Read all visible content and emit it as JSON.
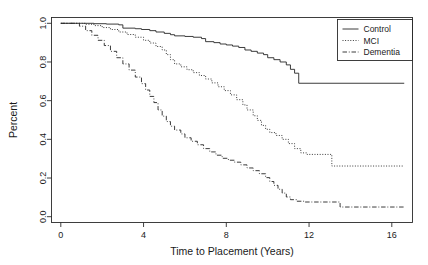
{
  "chart_data": {
    "type": "line",
    "subtype": "kaplan-meier-survival-step",
    "title": "",
    "xlabel": "Time to Placement (Years)",
    "ylabel": "Percent",
    "xlim": [
      -0.45,
      17.0
    ],
    "ylim": [
      -0.03,
      1.03
    ],
    "xticks": [
      0,
      4,
      8,
      12,
      16
    ],
    "xtick_labels": [
      "0",
      "4",
      "8",
      "12",
      "16"
    ],
    "yticks": [
      0.0,
      0.2,
      0.4,
      0.6,
      0.8,
      1.0
    ],
    "ytick_labels": [
      "0.0",
      "0.2",
      "0.4",
      "0.6",
      "0.8",
      "1.0"
    ],
    "grid": false,
    "legend_position": "top-right",
    "box": true,
    "series": [
      {
        "name": "Control",
        "linestyle": "solid",
        "color": "#262626",
        "final_value": 0.69,
        "points": [
          [
            0.0,
            1.0
          ],
          [
            1.0,
            1.0
          ],
          [
            1.6,
            0.998
          ],
          [
            2.2,
            0.996
          ],
          [
            2.8,
            0.992
          ],
          [
            3.0,
            0.975
          ],
          [
            3.6,
            0.972
          ],
          [
            3.9,
            0.968
          ],
          [
            4.3,
            0.962
          ],
          [
            4.6,
            0.955
          ],
          [
            5.0,
            0.948
          ],
          [
            5.3,
            0.941
          ],
          [
            5.5,
            0.935
          ],
          [
            6.0,
            0.932
          ],
          [
            6.4,
            0.928
          ],
          [
            6.8,
            0.921
          ],
          [
            7.0,
            0.905
          ],
          [
            7.4,
            0.9
          ],
          [
            7.7,
            0.893
          ],
          [
            8.0,
            0.888
          ],
          [
            8.3,
            0.882
          ],
          [
            8.6,
            0.875
          ],
          [
            8.9,
            0.862
          ],
          [
            9.2,
            0.855
          ],
          [
            9.5,
            0.846
          ],
          [
            9.8,
            0.838
          ],
          [
            10.0,
            0.822
          ],
          [
            10.3,
            0.812
          ],
          [
            10.6,
            0.8
          ],
          [
            10.9,
            0.785
          ],
          [
            11.1,
            0.762
          ],
          [
            11.3,
            0.742
          ],
          [
            11.5,
            0.69
          ],
          [
            16.6,
            0.69
          ]
        ]
      },
      {
        "name": "MCI",
        "linestyle": "dotted",
        "color": "#3a3a3a",
        "final_value": 0.26,
        "points": [
          [
            0.0,
            1.0
          ],
          [
            0.9,
            1.0
          ],
          [
            1.2,
            0.995
          ],
          [
            1.6,
            0.988
          ],
          [
            2.0,
            0.978
          ],
          [
            2.4,
            0.968
          ],
          [
            2.8,
            0.955
          ],
          [
            3.2,
            0.942
          ],
          [
            3.6,
            0.928
          ],
          [
            4.0,
            0.912
          ],
          [
            4.3,
            0.898
          ],
          [
            4.6,
            0.88
          ],
          [
            4.9,
            0.862
          ],
          [
            5.1,
            0.838
          ],
          [
            5.3,
            0.812
          ],
          [
            5.5,
            0.79
          ],
          [
            5.8,
            0.775
          ],
          [
            6.1,
            0.76
          ],
          [
            6.4,
            0.745
          ],
          [
            6.7,
            0.73
          ],
          [
            7.0,
            0.712
          ],
          [
            7.3,
            0.692
          ],
          [
            7.6,
            0.672
          ],
          [
            7.9,
            0.652
          ],
          [
            8.2,
            0.63
          ],
          [
            8.5,
            0.605
          ],
          [
            8.8,
            0.578
          ],
          [
            9.0,
            0.552
          ],
          [
            9.3,
            0.522
          ],
          [
            9.5,
            0.498
          ],
          [
            9.7,
            0.472
          ],
          [
            9.9,
            0.452
          ],
          [
            10.1,
            0.435
          ],
          [
            10.4,
            0.42
          ],
          [
            10.7,
            0.4
          ],
          [
            11.0,
            0.378
          ],
          [
            11.3,
            0.352
          ],
          [
            11.6,
            0.33
          ],
          [
            11.9,
            0.322
          ],
          [
            13.0,
            0.322
          ],
          [
            13.1,
            0.262
          ],
          [
            16.6,
            0.262
          ]
        ]
      },
      {
        "name": "Dementia",
        "linestyle": "dashdot",
        "color": "#3a3a3a",
        "final_value": 0.05,
        "points": [
          [
            0.0,
            1.0
          ],
          [
            0.6,
            1.0
          ],
          [
            0.9,
            0.985
          ],
          [
            1.2,
            0.962
          ],
          [
            1.5,
            0.938
          ],
          [
            1.8,
            0.912
          ],
          [
            2.1,
            0.885
          ],
          [
            2.4,
            0.855
          ],
          [
            2.7,
            0.822
          ],
          [
            3.0,
            0.79
          ],
          [
            3.3,
            0.758
          ],
          [
            3.6,
            0.722
          ],
          [
            3.9,
            0.688
          ],
          [
            4.1,
            0.655
          ],
          [
            4.3,
            0.622
          ],
          [
            4.5,
            0.59
          ],
          [
            4.7,
            0.552
          ],
          [
            4.9,
            0.52
          ],
          [
            5.1,
            0.492
          ],
          [
            5.3,
            0.468
          ],
          [
            5.5,
            0.448
          ],
          [
            5.8,
            0.428
          ],
          [
            6.0,
            0.408
          ],
          [
            6.3,
            0.39
          ],
          [
            6.6,
            0.372
          ],
          [
            6.9,
            0.352
          ],
          [
            7.2,
            0.335
          ],
          [
            7.5,
            0.318
          ],
          [
            7.8,
            0.302
          ],
          [
            8.1,
            0.292
          ],
          [
            8.4,
            0.282
          ],
          [
            8.7,
            0.268
          ],
          [
            9.0,
            0.252
          ],
          [
            9.3,
            0.238
          ],
          [
            9.6,
            0.222
          ],
          [
            9.9,
            0.202
          ],
          [
            10.1,
            0.182
          ],
          [
            10.3,
            0.162
          ],
          [
            10.5,
            0.142
          ],
          [
            10.7,
            0.122
          ],
          [
            10.9,
            0.102
          ],
          [
            11.1,
            0.088
          ],
          [
            11.4,
            0.08
          ],
          [
            11.8,
            0.076
          ],
          [
            13.4,
            0.076
          ],
          [
            13.5,
            0.05
          ],
          [
            16.6,
            0.05
          ]
        ]
      }
    ],
    "legend": [
      {
        "label": "Control",
        "linestyle": "solid"
      },
      {
        "label": "MCI",
        "linestyle": "dotted"
      },
      {
        "label": "Dementia",
        "linestyle": "dashdot"
      }
    ]
  }
}
